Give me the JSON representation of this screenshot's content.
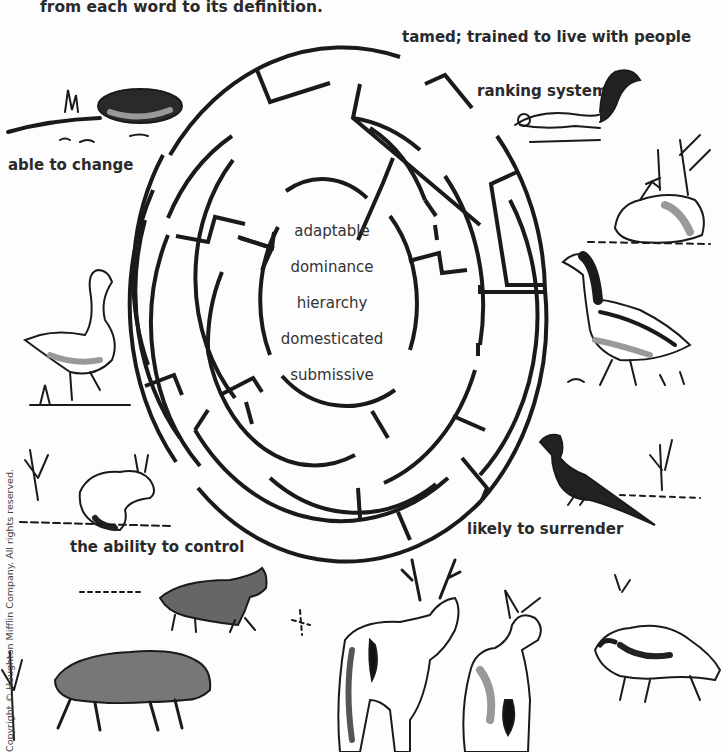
{
  "instruction": "from each word to its definition.",
  "definitions": [
    {
      "id": "tamed",
      "text": "tamed; trained to live with people"
    },
    {
      "id": "ranking",
      "text": "ranking system"
    },
    {
      "id": "able",
      "text": "able to change"
    },
    {
      "id": "ability",
      "text": "the ability to control"
    },
    {
      "id": "likely",
      "text": "likely to surrender"
    }
  ],
  "words": [
    "adaptable",
    "dominance",
    "hierarchy",
    "domesticated",
    "submissive"
  ],
  "copyright": "Copyright © Houghton Mifflin Company. All rights reserved.",
  "illustrations": [
    "mole",
    "squirrel",
    "rabbit-sitting",
    "goose-left",
    "goose-right",
    "hare",
    "pheasant",
    "wolf-small",
    "wolf-large",
    "stag",
    "doe",
    "raccoon"
  ],
  "colors": {
    "ink": "#1a1a1a",
    "text": "#2a2a2a",
    "paper": "#fdfdfd",
    "shade": "#9a9a9a"
  }
}
